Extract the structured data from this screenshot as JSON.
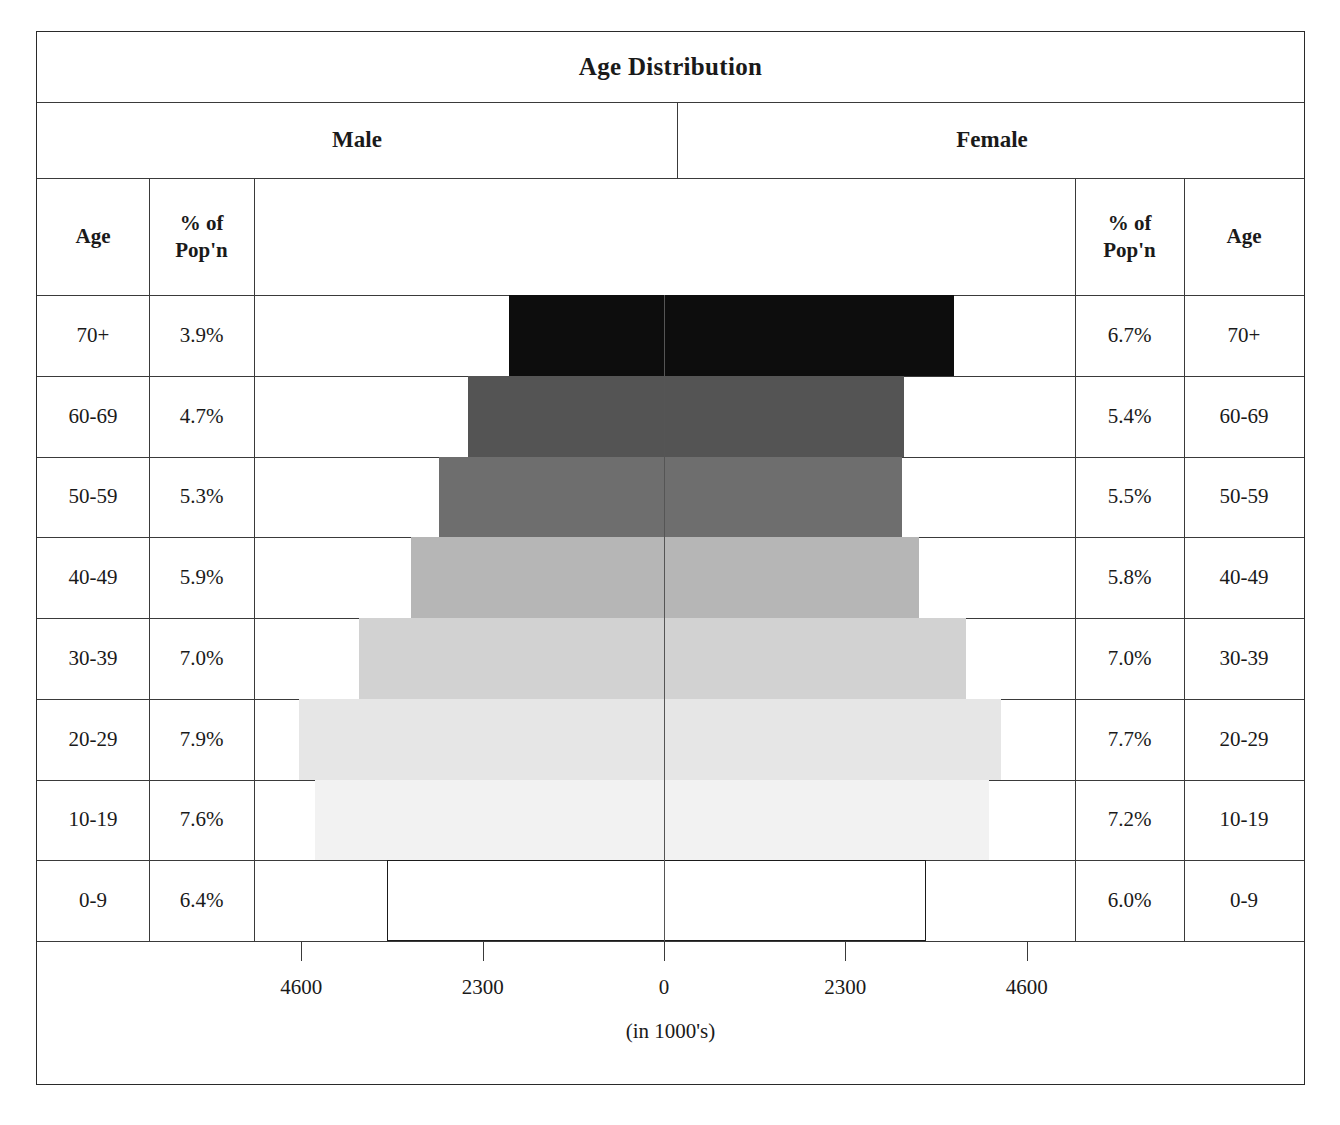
{
  "title": "Age Distribution",
  "headers": {
    "male": "Male",
    "female": "Female",
    "age_left": "Age",
    "pct_left": "% of\nPop'n",
    "pct_left_line1": "% of",
    "pct_left_line2": "Pop'n",
    "age_right": "Age",
    "pct_right_line1": "% of",
    "pct_right_line2": "Pop'n"
  },
  "axis": {
    "label": "(in 1000's)",
    "ticks": [
      "4600",
      "2300",
      "0",
      "2300",
      "4600"
    ],
    "tick_values": [
      -4600,
      -2300,
      0,
      2300,
      4600
    ],
    "max": 5200
  },
  "rows": [
    {
      "age": "70+",
      "male_pct": "3.9%",
      "female_pct": "6.7%",
      "male_value": 1960,
      "female_value": 3680,
      "color": "#0d0d0d",
      "outline": "#0d0d0d"
    },
    {
      "age": "60-69",
      "male_pct": "4.7%",
      "female_pct": "5.4%",
      "male_value": 2490,
      "female_value": 3050,
      "color": "#545454",
      "outline": "#545454"
    },
    {
      "age": "50-59",
      "male_pct": "5.3%",
      "female_pct": "5.5%",
      "male_value": 2860,
      "female_value": 3020,
      "color": "#6e6e6e",
      "outline": "#6e6e6e"
    },
    {
      "age": "40-49",
      "male_pct": "5.9%",
      "female_pct": "5.8%",
      "male_value": 3210,
      "female_value": 3240,
      "color": "#b6b6b6",
      "outline": "#b6b6b6"
    },
    {
      "age": "30-39",
      "male_pct": "7.0%",
      "female_pct": "7.0%",
      "male_value": 3870,
      "female_value": 3830,
      "color": "#d2d2d2",
      "outline": "#d2d2d2"
    },
    {
      "age": "20-29",
      "male_pct": "7.9%",
      "female_pct": "7.7%",
      "male_value": 4630,
      "female_value": 4270,
      "color": "#e6e6e6",
      "outline": "#e6e6e6"
    },
    {
      "age": "10-19",
      "male_pct": "7.6%",
      "female_pct": "7.2%",
      "male_value": 4430,
      "female_value": 4120,
      "color": "#f2f2f2",
      "outline": "#f2f2f2"
    },
    {
      "age": "0-9",
      "male_pct": "6.4%",
      "female_pct": "6.0%",
      "male_value": 3510,
      "female_value": 3320,
      "color": "#ffffff",
      "outline": "#1a1a1a"
    }
  ],
  "chart_data": {
    "type": "bar",
    "title": "Age Distribution",
    "xlabel": "(in 1000's)",
    "ylabel": "Age",
    "orientation": "population-pyramid",
    "categories": [
      "70+",
      "60-69",
      "50-59",
      "40-49",
      "30-39",
      "20-29",
      "10-19",
      "0-9"
    ],
    "xlim": [
      -5200,
      5200
    ],
    "xticks": [
      -4600,
      -2300,
      0,
      2300,
      4600
    ],
    "xticklabels": [
      "4600",
      "2300",
      "0",
      "2300",
      "4600"
    ],
    "grid": false,
    "legend": "none",
    "series": [
      {
        "name": "Male",
        "side": "left",
        "values": [
          1960,
          2490,
          2860,
          3210,
          3870,
          4630,
          4430,
          3510
        ],
        "percent_labels": [
          "3.9%",
          "4.7%",
          "5.3%",
          "5.9%",
          "7.0%",
          "7.9%",
          "7.6%",
          "6.4%"
        ],
        "percents": [
          3.9,
          4.7,
          5.3,
          5.9,
          7.0,
          7.9,
          7.6,
          6.4
        ]
      },
      {
        "name": "Female",
        "side": "right",
        "values": [
          3680,
          3050,
          3020,
          3240,
          3830,
          4270,
          4120,
          3320
        ],
        "percent_labels": [
          "6.7%",
          "5.4%",
          "5.5%",
          "5.8%",
          "7.0%",
          "7.7%",
          "7.2%",
          "6.0%"
        ],
        "percents": [
          6.7,
          5.4,
          5.5,
          5.8,
          7.0,
          7.7,
          7.2,
          6.0
        ]
      }
    ],
    "bar_colors": [
      "#0d0d0d",
      "#545454",
      "#6e6e6e",
      "#b6b6b6",
      "#d2d2d2",
      "#e6e6e6",
      "#f2f2f2",
      "#ffffff"
    ],
    "units": "thousands"
  }
}
